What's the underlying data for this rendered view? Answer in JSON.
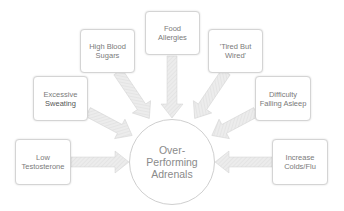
{
  "diagram": {
    "center": {
      "lines": [
        "Over-",
        "Performing",
        "Adrenals"
      ]
    },
    "nodes": [
      {
        "id": "low-testosterone",
        "lines": [
          "Low",
          "Testosterone"
        ]
      },
      {
        "id": "excessive-sweating",
        "lines": [
          "Excessive",
          "Sweating"
        ]
      },
      {
        "id": "high-blood-sugars",
        "lines": [
          "High Blood",
          "Sugars"
        ]
      },
      {
        "id": "food-allergies",
        "lines": [
          "Food",
          "Allergies"
        ]
      },
      {
        "id": "tired-but-wired",
        "lines": [
          "'Tired But",
          "Wired'"
        ]
      },
      {
        "id": "difficulty-falling-asleep",
        "lines": [
          "Difficulty",
          "Falling Asleep"
        ]
      },
      {
        "id": "increase-colds-flu",
        "lines": [
          "Increase",
          "Colds/Flu"
        ]
      }
    ],
    "colors": {
      "arrow_fill": "#e6e6e6",
      "arrow_stroke": "#cccccc",
      "box_border": "#d4d4d4",
      "text": "#7a7a7a"
    }
  }
}
